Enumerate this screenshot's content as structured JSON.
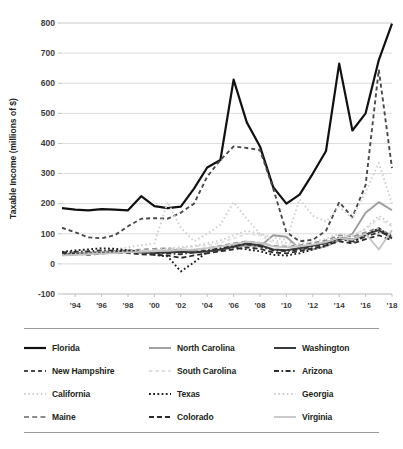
{
  "chart_data": {
    "type": "line",
    "title": "",
    "subtitle": "",
    "xlabel": "",
    "ylabel": "Taxable Income (millions of $)",
    "grid": true,
    "legend_position": "bottom",
    "ylim": [
      -100,
      800
    ],
    "yticks": [
      800,
      700,
      600,
      500,
      400,
      300,
      200,
      100,
      0,
      -100
    ],
    "ytick_labels": [
      "800",
      "700",
      "600",
      "500",
      "400",
      "300",
      "200",
      "100",
      "0",
      "-100"
    ],
    "xticks": [
      1994,
      1996,
      1998,
      2000,
      2002,
      2004,
      2006,
      2008,
      2010,
      2012,
      2014,
      2016,
      2018
    ],
    "xtick_labels": [
      "'94",
      "'96",
      "'98",
      "'00",
      "'02",
      "'04",
      "'06",
      "'08",
      "'10",
      "'12",
      "'14",
      "'16",
      "'18"
    ],
    "xlim": [
      1993,
      2018
    ],
    "x": [
      1993,
      1994,
      1995,
      1996,
      1997,
      1998,
      1999,
      2000,
      2001,
      2002,
      2003,
      2004,
      2005,
      2006,
      2007,
      2008,
      2009,
      2010,
      2011,
      2012,
      2013,
      2014,
      2015,
      2016,
      2017,
      2018
    ],
    "series": [
      {
        "name": "Florida",
        "color": "#111111",
        "width": 2.2,
        "dash": "none",
        "values": [
          185,
          180,
          178,
          182,
          180,
          178,
          225,
          192,
          185,
          190,
          250,
          320,
          345,
          612,
          470,
          390,
          255,
          200,
          230,
          300,
          375,
          665,
          443,
          500,
          677,
          798
        ]
      },
      {
        "name": "New Hampshire",
        "color": "#4a4a4a",
        "width": 1.9,
        "dash": "4,3",
        "values": [
          120,
          105,
          88,
          85,
          95,
          125,
          150,
          152,
          150,
          170,
          200,
          290,
          345,
          390,
          385,
          378,
          250,
          105,
          75,
          80,
          110,
          205,
          155,
          262,
          645,
          318
        ]
      },
      {
        "name": "California",
        "color": "#d2d2d2",
        "width": 1.9,
        "dash": "1.6,2.6",
        "values": [
          30,
          32,
          36,
          40,
          48,
          55,
          62,
          68,
          205,
          120,
          75,
          100,
          130,
          205,
          150,
          100,
          88,
          80,
          215,
          160,
          140,
          190,
          150,
          240,
          335,
          200
        ]
      },
      {
        "name": "Maine",
        "color": "#8c8c8c",
        "width": 1.7,
        "dash": "5,3.2",
        "values": [
          35,
          38,
          36,
          40,
          42,
          45,
          48,
          50,
          52,
          48,
          45,
          52,
          60,
          68,
          75,
          70,
          60,
          58,
          62,
          70,
          78,
          95,
          90,
          105,
          120,
          92
        ]
      },
      {
        "name": "North Carolina",
        "color": "#9e9e9e",
        "width": 1.9,
        "dash": "none",
        "values": [
          33,
          35,
          38,
          40,
          42,
          45,
          42,
          40,
          45,
          48,
          42,
          40,
          45,
          55,
          62,
          58,
          95,
          90,
          50,
          48,
          58,
          78,
          100,
          170,
          205,
          178
        ]
      },
      {
        "name": "South Carolina",
        "color": "#e0e0e0",
        "width": 1.8,
        "dash": "3.4,3",
        "values": [
          28,
          30,
          32,
          35,
          38,
          40,
          42,
          45,
          48,
          52,
          58,
          62,
          70,
          85,
          100,
          95,
          70,
          62,
          58,
          62,
          72,
          88,
          95,
          115,
          150,
          125
        ]
      },
      {
        "name": "Texas",
        "color": "#1f1f1f",
        "width": 1.9,
        "dash": "1.8,2.4",
        "values": [
          40,
          45,
          48,
          52,
          50,
          45,
          40,
          30,
          25,
          -25,
          5,
          40,
          50,
          55,
          48,
          42,
          30,
          28,
          35,
          48,
          60,
          88,
          72,
          95,
          118,
          88
        ]
      },
      {
        "name": "Colorado",
        "color": "#2b2b2b",
        "width": 1.8,
        "dash": "5,3",
        "values": [
          32,
          35,
          30,
          34,
          38,
          36,
          32,
          30,
          28,
          20,
          28,
          35,
          42,
          48,
          55,
          50,
          38,
          35,
          42,
          52,
          62,
          75,
          68,
          82,
          95,
          78
        ]
      },
      {
        "name": "Washington",
        "color": "#3a3a3a",
        "width": 2.0,
        "dash": "none",
        "values": [
          30,
          32,
          34,
          36,
          38,
          40,
          38,
          36,
          38,
          40,
          38,
          42,
          48,
          58,
          68,
          62,
          48,
          45,
          52,
          60,
          70,
          85,
          80,
          98,
          112,
          85
        ]
      },
      {
        "name": "Arizona",
        "color": "#2f2f2f",
        "width": 1.8,
        "dash": "5,2.5,1.6,2.5",
        "values": [
          38,
          40,
          42,
          45,
          44,
          42,
          40,
          38,
          35,
          32,
          38,
          45,
          52,
          60,
          65,
          58,
          45,
          42,
          48,
          58,
          68,
          82,
          75,
          90,
          105,
          95
        ]
      },
      {
        "name": "Georgia",
        "color": "#cbcbcb",
        "width": 1.8,
        "dash": "1.5,2.8",
        "values": [
          30,
          33,
          35,
          38,
          40,
          42,
          45,
          48,
          52,
          55,
          60,
          68,
          78,
          95,
          110,
          100,
          78,
          70,
          68,
          72,
          85,
          100,
          92,
          118,
          160,
          130
        ]
      },
      {
        "name": "Virginia",
        "color": "#c4c4c4",
        "width": 1.8,
        "dash": "none",
        "values": [
          28,
          30,
          32,
          34,
          36,
          38,
          40,
          42,
          44,
          46,
          48,
          52,
          58,
          66,
          74,
          70,
          58,
          55,
          58,
          64,
          72,
          86,
          80,
          100,
          48,
          112
        ]
      }
    ]
  },
  "legend": {
    "items": [
      {
        "label": "Florida",
        "series": 0
      },
      {
        "label": "North Carolina",
        "series": 4
      },
      {
        "label": "Washington",
        "series": 8
      },
      {
        "label": "New Hampshire",
        "series": 1
      },
      {
        "label": "South Carolina",
        "series": 5
      },
      {
        "label": "Arizona",
        "series": 9
      },
      {
        "label": "California",
        "series": 2
      },
      {
        "label": "Texas",
        "series": 6
      },
      {
        "label": "Georgia",
        "series": 10
      },
      {
        "label": "Maine",
        "series": 3
      },
      {
        "label": "Colorado",
        "series": 7
      },
      {
        "label": "Virginia",
        "series": 11
      }
    ]
  }
}
